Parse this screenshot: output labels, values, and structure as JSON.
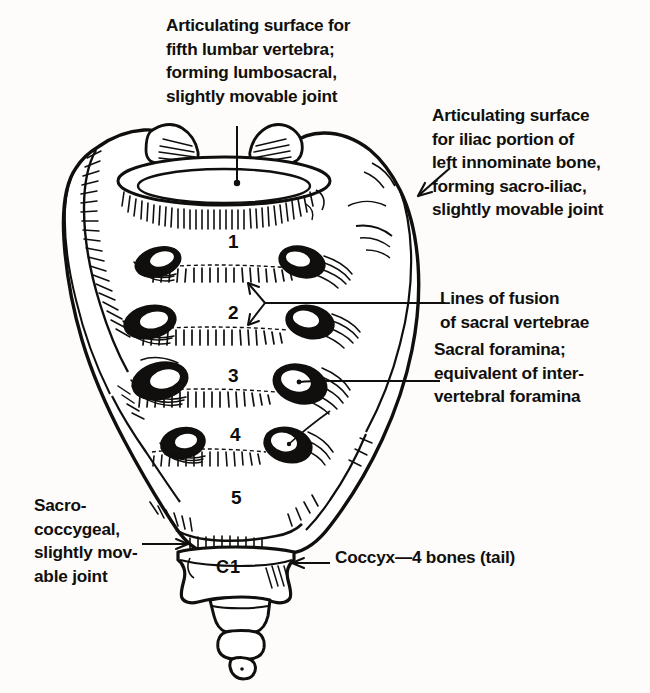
{
  "figure": {
    "ink_color": "#100f0d",
    "paper_color": "#fdfcfa"
  },
  "labels": {
    "lumbosacral": "Articulating surface for\nfifth lumbar vertebra;\nforming lumbosacral,\nslightly movable joint",
    "sacroiliac": "Articulating surface\nfor iliac portion of\nleft innominate bone,\nforming sacro-iliac,\nslightly movable joint",
    "lines_of_fusion": "Lines of fusion\n of sacral vertebrae",
    "sacral_foramina": "Sacral foramina;\nequivalent of inter-\nvertebral foramina",
    "sacrococcygeal": "Sacro-\ncoccygeal,\nslightly mov-\nable joint",
    "coccyx": "Coccyx—4 bones (tail)"
  },
  "vertebra_numbers": {
    "s1": "1",
    "s2": "2",
    "s3": "3",
    "s4": "4",
    "s5": "5",
    "c1": "C1"
  },
  "bleed_through": "· · · · · · · · · · · ·"
}
